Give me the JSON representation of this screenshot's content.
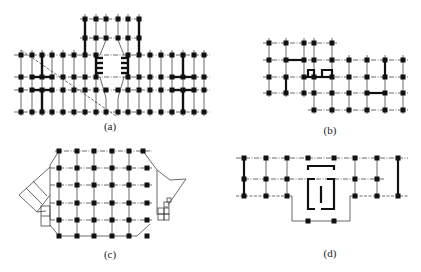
{
  "figure": {
    "panels": [
      {
        "id": "a",
        "label": "(a)",
        "label_x": 110,
        "label_y": 120
      },
      {
        "id": "b",
        "label": "(b)",
        "label_x": 330,
        "label_y": 124
      },
      {
        "id": "c",
        "label": "(c)",
        "label_x": 110,
        "label_y": 248
      },
      {
        "id": "d",
        "label": "(d)",
        "label_x": 330,
        "label_y": 247
      }
    ],
    "colors": {
      "line": "#333333",
      "column": "#111111",
      "wall": "#111111"
    }
  }
}
